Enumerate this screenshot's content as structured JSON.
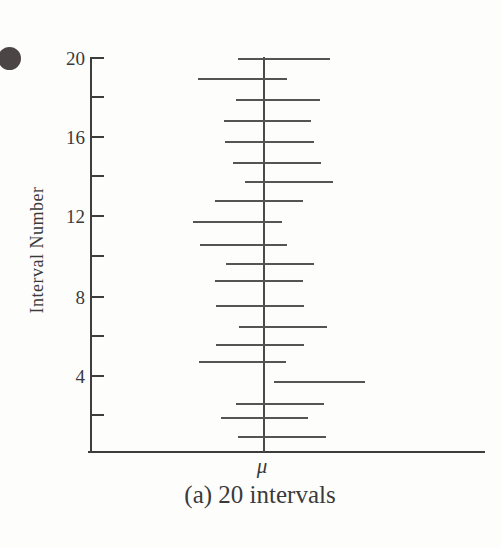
{
  "figure": {
    "bullet_icon": "filled-circle",
    "colors": {
      "background": "#fdfdfc",
      "axis": "#3d3d3d",
      "interval_line": "#545454",
      "mu_line": "#4a4a4a",
      "text": "#3a3a3a",
      "bullet": "#4b4546"
    }
  },
  "chart_data": {
    "type": "line",
    "subtype": "horizontal-confidence-intervals",
    "title": "(a) 20 intervals",
    "ylabel": "Interval Number",
    "xlabel": "",
    "x_center_label": "μ",
    "ylim": [
      0,
      20
    ],
    "grid": false,
    "legend": "none",
    "x_axis_note": "x axis has no tick labels; μ marks the true mean as a vertical reference line; interval endpoints given as pixel offsets from μ",
    "mu_x_px": 264,
    "axis_top_px": 57,
    "axis_bottom_px": 451,
    "y_ticks": [
      {
        "number": 20,
        "y_px": 58,
        "major": true,
        "label": "20"
      },
      {
        "number": 18,
        "y_px": 97,
        "major": false,
        "label": ""
      },
      {
        "number": 16,
        "y_px": 137,
        "major": true,
        "label": "16"
      },
      {
        "number": 14,
        "y_px": 176,
        "major": false,
        "label": ""
      },
      {
        "number": 12,
        "y_px": 216,
        "major": true,
        "label": "12"
      },
      {
        "number": 10,
        "y_px": 256,
        "major": false,
        "label": ""
      },
      {
        "number": 8,
        "y_px": 297,
        "major": true,
        "label": "8"
      },
      {
        "number": 6,
        "y_px": 336,
        "major": false,
        "label": ""
      },
      {
        "number": 4,
        "y_px": 376,
        "major": true,
        "label": "4"
      },
      {
        "number": 2,
        "y_px": 415,
        "major": false,
        "label": ""
      }
    ],
    "intervals": [
      {
        "number": 20,
        "y_px": 59,
        "left_offset_px": -26,
        "right_offset_px": 66,
        "contains_mu": true
      },
      {
        "number": 19,
        "y_px": 79,
        "left_offset_px": -66,
        "right_offset_px": 23,
        "contains_mu": true
      },
      {
        "number": 18,
        "y_px": 100,
        "left_offset_px": -28,
        "right_offset_px": 56,
        "contains_mu": true
      },
      {
        "number": 17,
        "y_px": 121,
        "left_offset_px": -40,
        "right_offset_px": 47,
        "contains_mu": true
      },
      {
        "number": 16,
        "y_px": 142,
        "left_offset_px": -39,
        "right_offset_px": 50,
        "contains_mu": true
      },
      {
        "number": 15,
        "y_px": 163,
        "left_offset_px": -31,
        "right_offset_px": 57,
        "contains_mu": true
      },
      {
        "number": 14,
        "y_px": 182,
        "left_offset_px": -19,
        "right_offset_px": 69,
        "contains_mu": true
      },
      {
        "number": 13,
        "y_px": 201,
        "left_offset_px": -49,
        "right_offset_px": 39,
        "contains_mu": true
      },
      {
        "number": 12,
        "y_px": 222,
        "left_offset_px": -71,
        "right_offset_px": 18,
        "contains_mu": true
      },
      {
        "number": 11,
        "y_px": 245,
        "left_offset_px": -64,
        "right_offset_px": 23,
        "contains_mu": true
      },
      {
        "number": 10,
        "y_px": 264,
        "left_offset_px": -38,
        "right_offset_px": 50,
        "contains_mu": true
      },
      {
        "number": 9,
        "y_px": 281,
        "left_offset_px": -49,
        "right_offset_px": 39,
        "contains_mu": true
      },
      {
        "number": 8,
        "y_px": 306,
        "left_offset_px": -48,
        "right_offset_px": 40,
        "contains_mu": true
      },
      {
        "number": 7,
        "y_px": 327,
        "left_offset_px": -25,
        "right_offset_px": 63,
        "contains_mu": true
      },
      {
        "number": 6,
        "y_px": 345,
        "left_offset_px": -48,
        "right_offset_px": 40,
        "contains_mu": true
      },
      {
        "number": 5,
        "y_px": 362,
        "left_offset_px": -65,
        "right_offset_px": 22,
        "contains_mu": true
      },
      {
        "number": 4,
        "y_px": 382,
        "left_offset_px": 10,
        "right_offset_px": 101,
        "contains_mu": false
      },
      {
        "number": 3,
        "y_px": 404,
        "left_offset_px": -28,
        "right_offset_px": 60,
        "contains_mu": true
      },
      {
        "number": 2,
        "y_px": 418,
        "left_offset_px": -43,
        "right_offset_px": 44,
        "contains_mu": true
      },
      {
        "number": 1,
        "y_px": 437,
        "left_offset_px": -26,
        "right_offset_px": 62,
        "contains_mu": true
      }
    ]
  }
}
